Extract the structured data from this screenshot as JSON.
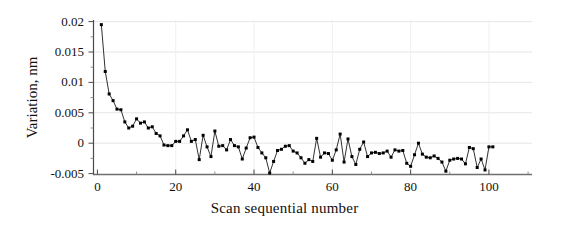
{
  "chart_data": {
    "type": "line",
    "title": "",
    "xlabel": "Scan sequential number",
    "ylabel": "Variation, nm",
    "xlim": [
      -1,
      111
    ],
    "ylim": [
      -0.0055,
      0.0205
    ],
    "xticks": [
      0,
      20,
      40,
      60,
      80,
      100
    ],
    "xtick_labels": [
      "0",
      "20",
      "40",
      "60",
      "80",
      "100"
    ],
    "yticks": [
      -0.005,
      0,
      0.005,
      0.01,
      0.015,
      0.02
    ],
    "ytick_labels": [
      "-0.005",
      "0",
      "0.005",
      "0.01",
      "0.015",
      "0.02"
    ],
    "grid": true,
    "grid_axis": "y",
    "legend": false,
    "marker": "filled-square",
    "line_color": "#1a1a1a",
    "marker_color": "#000000",
    "series": [
      {
        "name": "Variation",
        "x": [
          1,
          2,
          3,
          4,
          5,
          6,
          7,
          8,
          9,
          10,
          11,
          12,
          13,
          14,
          15,
          16,
          17,
          18,
          19,
          20,
          21,
          22,
          23,
          24,
          25,
          26,
          27,
          28,
          29,
          30,
          31,
          32,
          33,
          34,
          35,
          36,
          37,
          38,
          39,
          40,
          41,
          42,
          43,
          44,
          45,
          46,
          47,
          48,
          49,
          50,
          51,
          52,
          53,
          54,
          55,
          56,
          57,
          58,
          59,
          60,
          61,
          62,
          63,
          64,
          65,
          66,
          67,
          68,
          69,
          70,
          71,
          72,
          73,
          74,
          75,
          76,
          77,
          78,
          79,
          80,
          81,
          82,
          83,
          84,
          85,
          86,
          87,
          88,
          89,
          90,
          91,
          92,
          93,
          94,
          95,
          96,
          97,
          98,
          99,
          100,
          101
        ],
        "values": [
          0.0195,
          0.0118,
          0.0081,
          0.007,
          0.0056,
          0.0055,
          0.0035,
          0.0025,
          0.0028,
          0.004,
          0.0033,
          0.0035,
          0.0025,
          0.0027,
          0.0016,
          0.0012,
          -0.0003,
          -0.0004,
          -0.0004,
          0.0003,
          0.0003,
          0.0012,
          0.0022,
          0.0003,
          0.0006,
          -0.0027,
          0.0013,
          -0.0006,
          -0.0022,
          0.002,
          -0.0005,
          -0.0004,
          -0.0011,
          0.0006,
          -0.0004,
          -0.0006,
          -0.0026,
          -0.0008,
          0.0009,
          0.001,
          -0.0007,
          -0.0016,
          -0.0024,
          -0.0049,
          -0.003,
          -0.0012,
          -0.001,
          -0.0005,
          -0.0004,
          -0.0013,
          -0.0016,
          -0.0024,
          -0.0033,
          -0.0027,
          -0.003,
          0.0008,
          -0.0023,
          -0.0016,
          -0.0017,
          -0.0028,
          -0.0011,
          0.0015,
          -0.0031,
          0.0007,
          -0.0022,
          -0.0035,
          -0.001,
          0.0002,
          -0.0022,
          -0.0016,
          -0.0015,
          -0.0017,
          -0.0016,
          -0.0013,
          -0.0023,
          -0.0011,
          -0.0013,
          -0.0012,
          -0.0033,
          -0.0038,
          -0.0019,
          0.0,
          -0.0018,
          -0.0023,
          -0.0024,
          -0.0021,
          -0.0025,
          -0.0031,
          -0.0046,
          -0.0028,
          -0.0026,
          -0.0025,
          -0.0026,
          -0.0034,
          -0.0007,
          -0.0009,
          -0.004,
          -0.0026,
          -0.0044,
          -0.0006,
          -0.0006
        ]
      }
    ]
  }
}
